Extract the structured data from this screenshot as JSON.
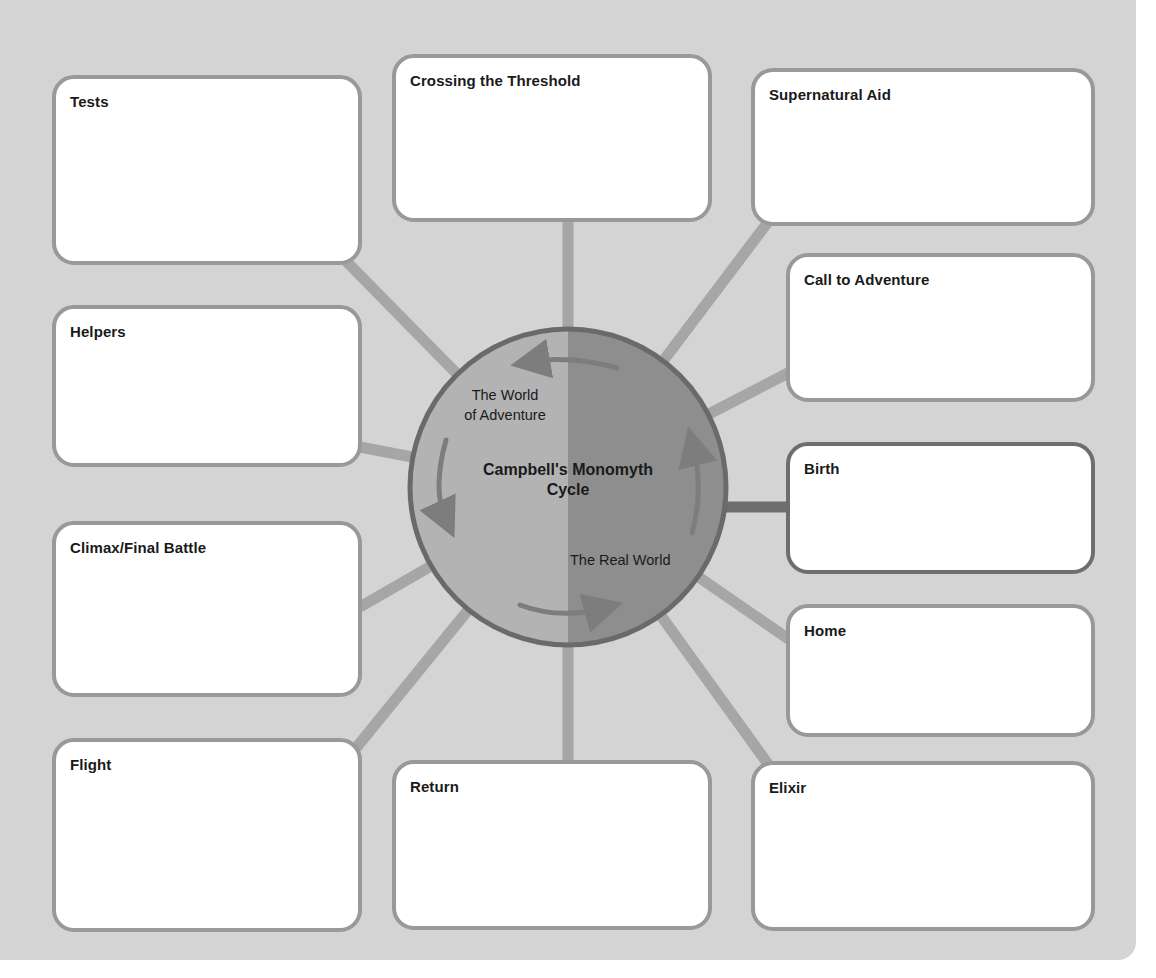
{
  "diagram": {
    "title_line1": "Campbell's Monomyth",
    "title_line2": "Cycle",
    "regions": {
      "left_label_line1": "The World",
      "left_label_line2": "of Adventure",
      "right_label": "The Real World"
    },
    "colors": {
      "background": "#d4d4d4",
      "box_border": "#999999",
      "box_border_highlight": "#6e6e6e",
      "connector": "#a6a6a6",
      "connector_highlight": "#6e6e6e",
      "circle_left": "#b3b3b3",
      "circle_right": "#8e8e8e",
      "circle_outline": "#6a6a6a",
      "arrow": "#7d7d7d"
    },
    "boxes": [
      {
        "id": "tests",
        "label": "Tests"
      },
      {
        "id": "crossing-the-threshold",
        "label": "Crossing the Threshold"
      },
      {
        "id": "supernatural-aid",
        "label": "Supernatural Aid"
      },
      {
        "id": "call-to-adventure",
        "label": "Call to Adventure"
      },
      {
        "id": "helpers",
        "label": "Helpers"
      },
      {
        "id": "birth",
        "label": "Birth"
      },
      {
        "id": "climax-final-battle",
        "label": "Climax/Final Battle"
      },
      {
        "id": "home",
        "label": "Home"
      },
      {
        "id": "flight",
        "label": "Flight"
      },
      {
        "id": "return",
        "label": "Return"
      },
      {
        "id": "elixir",
        "label": "Elixir"
      }
    ]
  }
}
